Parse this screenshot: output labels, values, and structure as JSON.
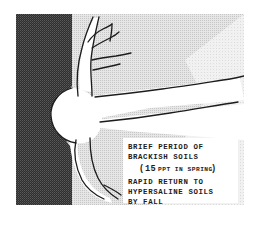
{
  "figure": {
    "annotation": {
      "lines": [
        "BRIEF PERIOD OF",
        "BRACKISH SOILS"
      ],
      "salinity_line": {
        "open_paren": "(",
        "value": "15",
        "unit_text": "PPT IN SPRING",
        "close_paren": ")"
      },
      "lines2": [
        "RAPID RETURN TO",
        "HYPERSALINE SOILS",
        "BY FALL"
      ]
    },
    "regions": {
      "dark_soil_label": "dark-soil-band",
      "light_soil_label": "light-soil-matrix",
      "freshwater_lens_label": "freshwater-lens",
      "tree_label": "tree-trunk-and-roots"
    },
    "colors": {
      "dark_soil": "#3a3a3a",
      "light_soil": "#d8d8d8",
      "pale_soil": "#ececec",
      "white": "#ffffff",
      "ink": "#1c1c1c"
    }
  }
}
